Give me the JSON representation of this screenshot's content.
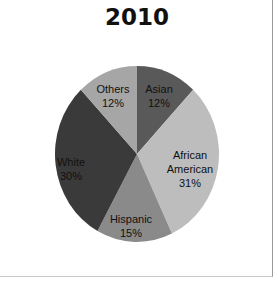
{
  "chart_data": {
    "type": "pie",
    "title": "2010",
    "categories": [
      "Asian",
      "African American",
      "Hispanic",
      "White",
      "Others"
    ],
    "values": [
      12,
      31,
      15,
      30,
      12
    ],
    "labels": [
      "Asian\n12%",
      "African\nAmerican\n31%",
      "Hispanic\n15%",
      "White\n30%",
      "Others\n12%"
    ],
    "colors": [
      "#595959",
      "#bdbdbd",
      "#8a8a8a",
      "#3a3a3a",
      "#a6a6a6"
    ],
    "start_angle": "12 o'clock, clockwise",
    "legend": "none (data labels inside slices)"
  },
  "title": "2010",
  "slices": [
    {
      "name": "Asian",
      "pct": "12%"
    },
    {
      "name_line1": "African",
      "name_line2": "American",
      "pct": "31%"
    },
    {
      "name": "Hispanic",
      "pct": "15%"
    },
    {
      "name": "White",
      "pct": "30%"
    },
    {
      "name": "Others",
      "pct": "12%"
    }
  ]
}
